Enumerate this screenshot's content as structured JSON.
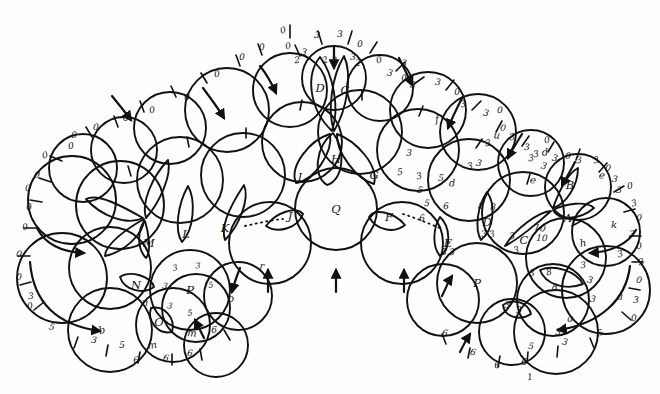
{
  "figure": {
    "type": "hand-drawn-diagram",
    "title": "",
    "background_color": "#ffffff",
    "ink_color": "#111111"
  },
  "chart_data": {
    "type": "diagram",
    "title": "",
    "petal_labels": [
      "A",
      "B",
      "C",
      "D",
      "E",
      "F",
      "G",
      "H",
      "I",
      "J",
      "K",
      "L",
      "M",
      "N",
      "O"
    ],
    "circle_labels": [
      "P",
      "Q",
      "P"
    ],
    "tick_numbers": [
      "0",
      "2",
      "3",
      "5",
      "6",
      "8",
      "10"
    ]
  },
  "capital_petals": [
    {
      "id": "A",
      "label": "A",
      "x": 568,
      "y": 218
    },
    {
      "id": "B",
      "label": "B",
      "x": 570,
      "y": 185
    },
    {
      "id": "C",
      "label": "C",
      "x": 524,
      "y": 240
    },
    {
      "id": "D",
      "label": "D",
      "x": 487,
      "y": 222
    },
    {
      "id": "E",
      "label": "E",
      "x": 448,
      "y": 243
    },
    {
      "id": "F",
      "label": "F",
      "x": 389,
      "y": 217
    },
    {
      "id": "G",
      "label": "G",
      "x": 374,
      "y": 175
    },
    {
      "id": "H",
      "label": "H",
      "x": 336,
      "y": 159
    },
    {
      "id": "I",
      "label": "I",
      "x": 300,
      "y": 177
    },
    {
      "id": "J",
      "label": "J",
      "x": 290,
      "y": 216
    },
    {
      "id": "K",
      "label": "K",
      "x": 225,
      "y": 228
    },
    {
      "id": "L",
      "label": "L",
      "x": 186,
      "y": 234
    },
    {
      "id": "M",
      "label": "M",
      "x": 149,
      "y": 243
    },
    {
      "id": "N",
      "label": "N",
      "x": 136,
      "y": 285
    },
    {
      "id": "O",
      "label": "O",
      "x": 159,
      "y": 322
    }
  ],
  "top_petals": [
    {
      "id": "D-top",
      "label": "D",
      "x": 320,
      "y": 88
    },
    {
      "id": "C-top",
      "label": "C",
      "x": 345,
      "y": 90
    }
  ],
  "big_circles": [
    {
      "id": "P-left",
      "label": "P",
      "x": 190,
      "y": 290,
      "inner_numbers": [
        {
          "v": "3",
          "x": 175,
          "y": 268
        },
        {
          "v": "3",
          "x": 198,
          "y": 266
        },
        {
          "v": "3",
          "x": 165,
          "y": 286
        },
        {
          "v": "5",
          "x": 211,
          "y": 285
        },
        {
          "v": "3",
          "x": 170,
          "y": 306
        },
        {
          "v": "5",
          "x": 190,
          "y": 313
        }
      ]
    },
    {
      "id": "Q-center",
      "label": "Q",
      "x": 336,
      "y": 209
    },
    {
      "id": "P-right",
      "label": "P",
      "x": 477,
      "y": 283
    }
  ],
  "lowercase_labels": [
    {
      "t": "b",
      "x": 102,
      "y": 330
    },
    {
      "t": "n",
      "x": 145,
      "y": 302
    },
    {
      "t": "m",
      "x": 152,
      "y": 345
    },
    {
      "t": "m",
      "x": 192,
      "y": 333
    },
    {
      "t": "o",
      "x": 231,
      "y": 298
    },
    {
      "t": "r",
      "x": 262,
      "y": 266
    },
    {
      "t": "f",
      "x": 437,
      "y": 119
    },
    {
      "t": "u",
      "x": 497,
      "y": 135
    },
    {
      "t": "d",
      "x": 545,
      "y": 152
    },
    {
      "t": "e",
      "x": 602,
      "y": 175
    },
    {
      "t": "d",
      "x": 452,
      "y": 183
    },
    {
      "t": "e",
      "x": 533,
      "y": 180
    },
    {
      "t": "k",
      "x": 614,
      "y": 224
    },
    {
      "t": "h",
      "x": 583,
      "y": 243
    },
    {
      "t": "a",
      "x": 620,
      "y": 296
    },
    {
      "t": "a",
      "x": 570,
      "y": 318
    }
  ],
  "tick_numbers_outer": [
    {
      "v": "0",
      "x": 283,
      "y": 30
    },
    {
      "v": "3",
      "x": 317,
      "y": 35
    },
    {
      "v": "3",
      "x": 340,
      "y": 34
    },
    {
      "v": "0",
      "x": 360,
      "y": 44
    },
    {
      "v": "0",
      "x": 288,
      "y": 46
    },
    {
      "v": "3",
      "x": 304,
      "y": 52
    },
    {
      "v": "3",
      "x": 353,
      "y": 57
    },
    {
      "v": "0",
      "x": 262,
      "y": 47
    },
    {
      "v": "0",
      "x": 379,
      "y": 60
    },
    {
      "v": "3",
      "x": 390,
      "y": 73
    },
    {
      "v": "3",
      "x": 404,
      "y": 63
    },
    {
      "v": "0",
      "x": 242,
      "y": 57
    },
    {
      "v": "0",
      "x": 404,
      "y": 78
    },
    {
      "v": "3",
      "x": 413,
      "y": 85
    },
    {
      "v": "3",
      "x": 438,
      "y": 82
    },
    {
      "v": "0",
      "x": 457,
      "y": 92
    },
    {
      "v": "0",
      "x": 217,
      "y": 74
    },
    {
      "v": "3",
      "x": 463,
      "y": 104
    },
    {
      "v": "3",
      "x": 486,
      "y": 113
    },
    {
      "v": "0",
      "x": 500,
      "y": 110
    },
    {
      "v": "2",
      "x": 297,
      "y": 60
    },
    {
      "v": "2",
      "x": 325,
      "y": 60
    },
    {
      "v": "2",
      "x": 334,
      "y": 60
    },
    {
      "v": "2",
      "x": 358,
      "y": 63
    },
    {
      "v": "0",
      "x": 187,
      "y": 97
    },
    {
      "v": "0",
      "x": 152,
      "y": 110
    },
    {
      "v": "0",
      "x": 126,
      "y": 118
    },
    {
      "v": "0",
      "x": 96,
      "y": 127
    },
    {
      "v": "0",
      "x": 74,
      "y": 135
    },
    {
      "v": "0",
      "x": 71,
      "y": 146
    },
    {
      "v": "0",
      "x": 45,
      "y": 155
    },
    {
      "v": "0",
      "x": 37,
      "y": 175
    },
    {
      "v": "0",
      "x": 28,
      "y": 188
    },
    {
      "v": "0",
      "x": 29,
      "y": 207
    },
    {
      "v": "0",
      "x": 25,
      "y": 227
    },
    {
      "v": "0",
      "x": 19,
      "y": 254
    },
    {
      "v": "0",
      "x": 19,
      "y": 277
    },
    {
      "v": "3",
      "x": 31,
      "y": 296
    },
    {
      "v": "0",
      "x": 30,
      "y": 306
    },
    {
      "v": "5",
      "x": 52,
      "y": 327
    },
    {
      "v": "3",
      "x": 94,
      "y": 340
    },
    {
      "v": "5",
      "x": 122,
      "y": 345
    },
    {
      "v": "6",
      "x": 136,
      "y": 360
    },
    {
      "v": "6",
      "x": 166,
      "y": 358
    },
    {
      "v": "6",
      "x": 190,
      "y": 353
    },
    {
      "v": "6",
      "x": 214,
      "y": 330
    },
    {
      "v": "3",
      "x": 488,
      "y": 143
    },
    {
      "v": "3",
      "x": 512,
      "y": 137
    },
    {
      "v": "0",
      "x": 503,
      "y": 128
    },
    {
      "v": "3",
      "x": 527,
      "y": 147
    },
    {
      "v": "3",
      "x": 531,
      "y": 158
    },
    {
      "v": "0",
      "x": 547,
      "y": 140
    },
    {
      "v": "3",
      "x": 555,
      "y": 158
    },
    {
      "v": "0",
      "x": 568,
      "y": 156
    },
    {
      "v": "3",
      "x": 579,
      "y": 160
    },
    {
      "v": "3",
      "x": 596,
      "y": 160
    },
    {
      "v": "0",
      "x": 608,
      "y": 168
    },
    {
      "v": "3",
      "x": 615,
      "y": 179
    },
    {
      "v": "3",
      "x": 619,
      "y": 190
    },
    {
      "v": "0",
      "x": 630,
      "y": 186
    },
    {
      "v": "3",
      "x": 634,
      "y": 203
    },
    {
      "v": "0",
      "x": 639,
      "y": 218
    },
    {
      "v": "3",
      "x": 632,
      "y": 234
    },
    {
      "v": "0",
      "x": 639,
      "y": 246
    },
    {
      "v": "3",
      "x": 641,
      "y": 262
    },
    {
      "v": "0",
      "x": 639,
      "y": 280
    },
    {
      "v": "3",
      "x": 636,
      "y": 300
    },
    {
      "v": "0",
      "x": 634,
      "y": 318
    },
    {
      "v": "5",
      "x": 600,
      "y": 333
    },
    {
      "v": "3",
      "x": 565,
      "y": 342
    },
    {
      "v": "5",
      "x": 531,
      "y": 346
    },
    {
      "v": "6",
      "x": 524,
      "y": 362
    },
    {
      "v": "6",
      "x": 497,
      "y": 365
    },
    {
      "v": "6",
      "x": 473,
      "y": 352
    },
    {
      "v": "6",
      "x": 445,
      "y": 333
    },
    {
      "v": "3",
      "x": 409,
      "y": 153
    },
    {
      "v": "5",
      "x": 400,
      "y": 172
    },
    {
      "v": "3",
      "x": 419,
      "y": 176
    },
    {
      "v": "5",
      "x": 420,
      "y": 190
    },
    {
      "v": "5",
      "x": 427,
      "y": 203
    },
    {
      "v": "6",
      "x": 422,
      "y": 218
    },
    {
      "v": "3",
      "x": 470,
      "y": 166
    },
    {
      "v": "3",
      "x": 479,
      "y": 163
    },
    {
      "v": "5",
      "x": 441,
      "y": 178
    },
    {
      "v": "6",
      "x": 446,
      "y": 206
    },
    {
      "v": "3",
      "x": 536,
      "y": 154
    },
    {
      "v": "3",
      "x": 544,
      "y": 166
    },
    {
      "v": "8",
      "x": 481,
      "y": 206
    },
    {
      "v": "8",
      "x": 493,
      "y": 207
    },
    {
      "v": "3",
      "x": 484,
      "y": 234
    },
    {
      "v": "3",
      "x": 492,
      "y": 234
    },
    {
      "v": "3",
      "x": 444,
      "y": 252
    },
    {
      "v": "3",
      "x": 452,
      "y": 252
    },
    {
      "v": "3",
      "x": 512,
      "y": 236
    },
    {
      "v": "3",
      "x": 516,
      "y": 250
    },
    {
      "v": "10",
      "x": 540,
      "y": 228
    },
    {
      "v": "10",
      "x": 542,
      "y": 238
    },
    {
      "v": "3",
      "x": 532,
      "y": 273
    },
    {
      "v": "8",
      "x": 549,
      "y": 272
    },
    {
      "v": "8",
      "x": 555,
      "y": 287
    },
    {
      "v": "3",
      "x": 507,
      "y": 305
    },
    {
      "v": "3",
      "x": 519,
      "y": 310
    },
    {
      "v": "3",
      "x": 583,
      "y": 265
    },
    {
      "v": "3",
      "x": 590,
      "y": 280
    },
    {
      "v": "3",
      "x": 593,
      "y": 299
    },
    {
      "v": "3",
      "x": 558,
      "y": 332
    },
    {
      "v": "1",
      "x": 530,
      "y": 377
    },
    {
      "v": "3",
      "x": 620,
      "y": 254
    }
  ],
  "dotted_connectors": [
    {
      "id": "left-dotted",
      "from": [
        245,
        226
      ],
      "to": [
        283,
        219
      ]
    },
    {
      "id": "right-dotted",
      "from": [
        403,
        214
      ],
      "to": [
        440,
        228
      ]
    }
  ]
}
